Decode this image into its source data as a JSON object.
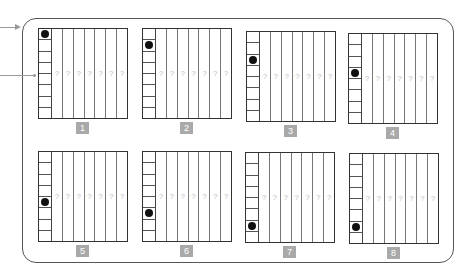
{
  "diagram": {
    "title": "",
    "colors": {
      "frame": "#555555",
      "grid_line": "#333333",
      "dot": "#111111",
      "question_mark": "#bdbdbd",
      "label_bg": "#a9a9a9",
      "label_text": "#ffffff",
      "arrow": "#9a9a9a"
    },
    "arrows": [
      {
        "type": "arrowhead",
        "points_to": "frame"
      },
      {
        "type": "dot-end",
        "points_to": "first-column-row"
      }
    ],
    "grid": {
      "rows_in_first_column": 8,
      "value_columns": 7,
      "placeholder": "?"
    },
    "panels": [
      {
        "label": "1",
        "dot_row": 0,
        "placeholders": [
          "?",
          "?",
          "?",
          "?",
          "?",
          "?",
          "?"
        ]
      },
      {
        "label": "2",
        "dot_row": 1,
        "placeholders": [
          "?",
          "?",
          "?",
          "?",
          "?",
          "?",
          "?"
        ]
      },
      {
        "label": "3",
        "dot_row": 2,
        "placeholders": [
          "?",
          "?",
          "?",
          "?",
          "?",
          "?",
          "?"
        ]
      },
      {
        "label": "4",
        "dot_row": 3,
        "placeholders": [
          "?",
          "?",
          "?",
          "?",
          "?",
          "?",
          "?"
        ]
      },
      {
        "label": "5",
        "dot_row": 4,
        "placeholders": [
          "?",
          "?",
          "?",
          "?",
          "?",
          "?",
          "?"
        ]
      },
      {
        "label": "6",
        "dot_row": 5,
        "placeholders": [
          "?",
          "?",
          "?",
          "?",
          "?",
          "?",
          "?"
        ]
      },
      {
        "label": "7",
        "dot_row": 6,
        "placeholders": [
          "?",
          "?",
          "?",
          "?",
          "?",
          "?",
          "?"
        ]
      },
      {
        "label": "8",
        "dot_row": 6,
        "placeholders": [
          "?",
          "?",
          "?",
          "?",
          "?",
          "?",
          "?"
        ]
      }
    ]
  }
}
